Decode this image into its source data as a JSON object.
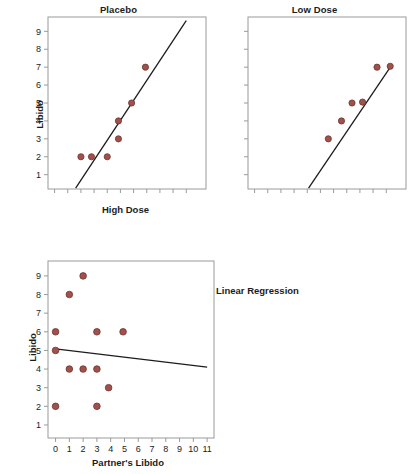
{
  "figure": {
    "annotation_label": "Linear Regression",
    "marker_color": "#a0514b",
    "marker_edge_color": "#6f3430",
    "line_color": "#1c1c1c",
    "frame_color": "#9a9a9a"
  },
  "chart_data": [
    {
      "type": "scatter",
      "title": "Placebo",
      "xlabel": "High Dose",
      "ylabel": "Libido",
      "xlim": [
        -0.5,
        11.5
      ],
      "ylim": [
        0.2,
        9.8
      ],
      "grid": false,
      "legend": "none",
      "xticklabels": [
        "",
        "",
        "",
        "",
        "",
        "",
        "",
        "",
        "",
        "",
        ""
      ],
      "xticks": [
        0,
        1,
        2,
        3,
        4,
        5,
        6,
        7,
        8,
        9,
        10
      ],
      "yticks": [
        1,
        2,
        3,
        4,
        5,
        6,
        7,
        8,
        9
      ],
      "yticklabels": [
        "1",
        "2",
        "3",
        "4",
        "5",
        "6",
        "7",
        "8",
        "9"
      ],
      "points": [
        {
          "x": 2.0,
          "y": 2.0
        },
        {
          "x": 2.8,
          "y": 2.0
        },
        {
          "x": 4.0,
          "y": 2.0
        },
        {
          "x": 4.85,
          "y": 4.0
        },
        {
          "x": 4.85,
          "y": 3.0
        },
        {
          "x": 5.85,
          "y": 5.0
        },
        {
          "x": 6.9,
          "y": 7.0
        }
      ],
      "fit_line": {
        "x0": 1.6,
        "y0": 0.25,
        "x1": 10.0,
        "y1": 9.6
      }
    },
    {
      "type": "scatter",
      "title": "Low Dose",
      "xlabel": "",
      "ylabel": "",
      "xlim": [
        -0.5,
        11.5
      ],
      "ylim": [
        0.2,
        9.8
      ],
      "grid": false,
      "legend": "none",
      "xticks": [
        0,
        1,
        2,
        3,
        4,
        5,
        6,
        7,
        8,
        9,
        10
      ],
      "xticklabels": [
        "",
        "",
        "",
        "",
        "",
        "",
        "",
        "",
        "",
        "",
        ""
      ],
      "yticks": [
        1,
        2,
        3,
        4,
        5,
        6,
        7,
        8,
        9
      ],
      "yticklabels": [
        "",
        "",
        "",
        "",
        "",
        "",
        "",
        "",
        ""
      ],
      "points": [
        {
          "x": 5.6,
          "y": 3.0
        },
        {
          "x": 6.6,
          "y": 4.0
        },
        {
          "x": 7.4,
          "y": 5.0
        },
        {
          "x": 8.2,
          "y": 5.05
        },
        {
          "x": 9.3,
          "y": 7.0
        },
        {
          "x": 10.3,
          "y": 7.05
        }
      ],
      "fit_line": {
        "x0": 4.1,
        "y0": 0.25,
        "x1": 10.4,
        "y1": 7.1
      }
    },
    {
      "type": "scatter",
      "title": "",
      "xlabel": "Partner's Libido",
      "ylabel": "Libido",
      "xlim": [
        -0.55,
        11.5
      ],
      "ylim": [
        0.3,
        9.8
      ],
      "grid": false,
      "legend": "none",
      "xticks": [
        0,
        1,
        2,
        3,
        4,
        5,
        6,
        7,
        8,
        9,
        10,
        11
      ],
      "xticklabels": [
        "0",
        "1",
        "2",
        "3",
        "4",
        "5",
        "6",
        "7",
        "8",
        "9",
        "10",
        "11"
      ],
      "yticks": [
        1,
        2,
        3,
        4,
        5,
        6,
        7,
        8,
        9
      ],
      "yticklabels": [
        "1",
        "2",
        "3",
        "4",
        "5",
        "6",
        "7",
        "8",
        "9"
      ],
      "points": [
        {
          "x": 0.0,
          "y": 6.0
        },
        {
          "x": 0.0,
          "y": 5.0
        },
        {
          "x": 0.0,
          "y": 2.0
        },
        {
          "x": 1.0,
          "y": 8.0
        },
        {
          "x": 1.0,
          "y": 4.0
        },
        {
          "x": 2.0,
          "y": 9.0
        },
        {
          "x": 2.0,
          "y": 4.0
        },
        {
          "x": 3.0,
          "y": 6.0
        },
        {
          "x": 3.0,
          "y": 4.0
        },
        {
          "x": 3.0,
          "y": 2.0
        },
        {
          "x": 3.85,
          "y": 3.0
        },
        {
          "x": 4.9,
          "y": 6.0
        }
      ],
      "fit_line": {
        "x0": 0.0,
        "y0": 5.08,
        "x1": 11.0,
        "y1": 4.1
      }
    }
  ]
}
